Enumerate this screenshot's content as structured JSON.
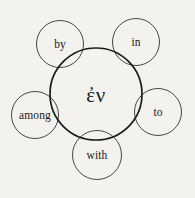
{
  "diagram": {
    "type": "radial-semantic-map",
    "background_color": "#f3f2ee",
    "stroke_color": "#1b1b19",
    "text_color": "#1a1a18",
    "center": {
      "label": "ἐν",
      "transliteration_icon": "greek-preposition-en",
      "cx": 96,
      "cy": 94,
      "r": 46,
      "stroke_width": 1.7
    },
    "satellites": [
      {
        "id": "by",
        "label": "by",
        "cx": 60,
        "cy": 44,
        "r": 23.5,
        "stroke_width": 0.8
      },
      {
        "id": "in",
        "label": "in",
        "cx": 136,
        "cy": 42,
        "r": 23.5,
        "stroke_width": 0.8
      },
      {
        "id": "among",
        "label": "among",
        "cx": 35,
        "cy": 115,
        "r": 23.5,
        "stroke_width": 0.8
      },
      {
        "id": "to",
        "label": "to",
        "cx": 158,
        "cy": 112,
        "r": 23.5,
        "stroke_width": 0.8
      },
      {
        "id": "with",
        "label": "with",
        "cx": 97,
        "cy": 155,
        "r": 24.5,
        "stroke_width": 0.8
      }
    ]
  }
}
